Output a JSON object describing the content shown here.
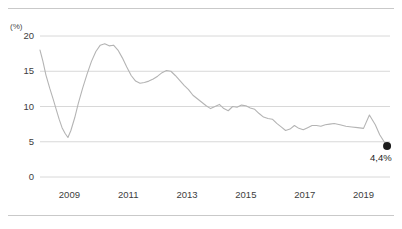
{
  "chart_data": {
    "type": "line",
    "title": "",
    "subtitle": "",
    "xlabel": "",
    "ylabel": "",
    "unit_label": "(%)",
    "ylim": [
      0,
      20
    ],
    "xlim": [
      2008.0,
      2019.9
    ],
    "yticks": [
      0,
      5,
      10,
      15,
      20
    ],
    "ytick_labels": [
      "0",
      "5",
      "10",
      "15",
      "20"
    ],
    "xticks": [
      2009,
      2011,
      2013,
      2015,
      2017,
      2019
    ],
    "xtick_labels": [
      "2009",
      "2011",
      "2013",
      "2015",
      "2017",
      "2019"
    ],
    "grid": true,
    "grid_axis": "y",
    "legend": "none",
    "line_color": "#b4b4b4",
    "marker_color": "#1c1c1c",
    "grid_color": "#d8d8d8",
    "series": [
      {
        "name": "unemployment-rate",
        "x": [
          2008.0,
          2008.1,
          2008.2,
          2008.33,
          2008.45,
          2008.55,
          2008.65,
          2008.75,
          2008.85,
          2008.95,
          2009.05,
          2009.18,
          2009.3,
          2009.45,
          2009.6,
          2009.75,
          2009.9,
          2010.05,
          2010.2,
          2010.35,
          2010.5,
          2010.65,
          2010.8,
          2010.95,
          2011.1,
          2011.25,
          2011.4,
          2011.55,
          2011.7,
          2011.85,
          2012.0,
          2012.15,
          2012.3,
          2012.45,
          2012.6,
          2012.75,
          2012.9,
          2013.05,
          2013.2,
          2013.35,
          2013.5,
          2013.65,
          2013.8,
          2013.95,
          2014.1,
          2014.25,
          2014.4,
          2014.55,
          2014.7,
          2014.85,
          2015.0,
          2015.15,
          2015.3,
          2015.45,
          2015.6,
          2015.75,
          2015.9,
          2016.05,
          2016.2,
          2016.35,
          2016.5,
          2016.65,
          2016.8,
          2016.95,
          2017.1,
          2017.25,
          2017.4,
          2017.55,
          2017.7,
          2017.85,
          2018.0,
          2018.2,
          2018.4,
          2018.6,
          2018.8,
          2019.0,
          2019.2,
          2019.4,
          2019.55,
          2019.7,
          2019.8
        ],
        "y": [
          18.0,
          16.4,
          14.5,
          12.6,
          11.0,
          9.6,
          8.2,
          7.0,
          6.2,
          5.6,
          6.6,
          8.4,
          10.4,
          12.6,
          14.6,
          16.4,
          17.8,
          18.7,
          18.9,
          18.6,
          18.7,
          18.0,
          16.9,
          15.6,
          14.4,
          13.6,
          13.3,
          13.4,
          13.6,
          13.9,
          14.3,
          14.8,
          15.1,
          15.0,
          14.4,
          13.7,
          13.0,
          12.4,
          11.6,
          11.1,
          10.6,
          10.1,
          9.7,
          10.0,
          10.3,
          9.7,
          9.4,
          10.0,
          9.9,
          10.2,
          10.1,
          9.8,
          9.6,
          9.0,
          8.5,
          8.3,
          8.2,
          7.6,
          7.1,
          6.6,
          6.8,
          7.3,
          6.9,
          6.7,
          7.0,
          7.3,
          7.3,
          7.2,
          7.4,
          7.5,
          7.6,
          7.4,
          7.2,
          7.1,
          7.0,
          6.9,
          8.8,
          7.4,
          6.0,
          5.0,
          4.4
        ]
      }
    ],
    "annotations": [
      {
        "name": "endpoint-marker",
        "label": "4,4%",
        "x": 2019.8,
        "y": 4.4,
        "marker": "filled-circle"
      }
    ]
  }
}
